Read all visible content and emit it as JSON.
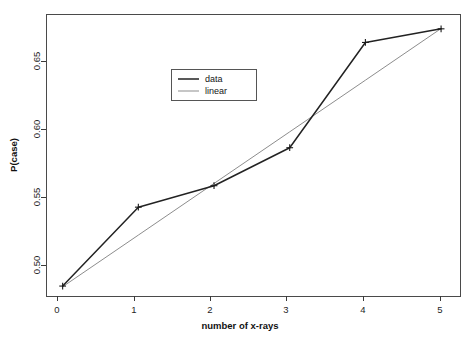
{
  "chart_data": {
    "type": "line",
    "title": "",
    "xlabel": "number of x-rays",
    "ylabel": "P(case)",
    "x": [
      0,
      1,
      2,
      3,
      4,
      5
    ],
    "xlim": [
      -0.22,
      5.25
    ],
    "ylim": [
      0.4755,
      0.6885
    ],
    "xticks": [
      0,
      1,
      2,
      3,
      4,
      5
    ],
    "xticklabels": [
      "0",
      "1",
      "2",
      "3",
      "4",
      "5"
    ],
    "yticks": [
      0.5,
      0.55,
      0.6,
      0.65
    ],
    "yticklabels": [
      "0.50",
      "0.55",
      "0.60",
      "0.65"
    ],
    "grid": false,
    "legend_position": "upper-center-left",
    "series": [
      {
        "name": "data",
        "label": "data",
        "color": "#222222",
        "marker": "plus",
        "values": [
          0.483,
          0.5426,
          0.5588,
          0.5875,
          0.667,
          0.6773
        ]
      },
      {
        "name": "linear",
        "label": "linear",
        "color": "#8d8d8d",
        "marker": "none",
        "values": [
          0.4825,
          0.5215,
          0.5605,
          0.5995,
          0.6385,
          0.6775
        ]
      }
    ],
    "legend_entries": [
      "data",
      "linear"
    ]
  },
  "axes": {
    "y_label": "P(case)",
    "x_label": "number of x-rays",
    "y_tick_labels": [
      "0.50",
      "0.55",
      "0.60",
      "0.65"
    ],
    "x_tick_labels": [
      "0",
      "1",
      "2",
      "3",
      "4",
      "5"
    ]
  },
  "legend": {
    "items": [
      {
        "label": "data"
      },
      {
        "label": "linear"
      }
    ]
  },
  "colors": {
    "data_series": "#222222",
    "linear_series": "#8d8d8d",
    "axis": "#3a3a3a",
    "background": "#ffffff"
  }
}
